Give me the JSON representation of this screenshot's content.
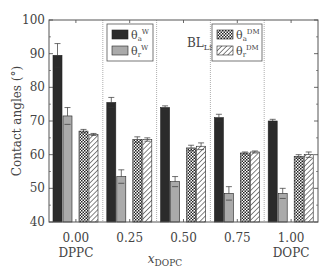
{
  "chart_data": {
    "type": "bar",
    "title": "",
    "xlabel": "x_DOPC",
    "xlabel_main": "x",
    "xlabel_sub": "DOPC",
    "ylabel": "Contact angles (°)",
    "ylim": [
      40,
      100
    ],
    "yticks": [
      40,
      50,
      60,
      70,
      80,
      90,
      100
    ],
    "categories": [
      "0.00",
      "0.25",
      "0.50",
      "0.75",
      "1.00"
    ],
    "category_sublabels": [
      "DPPC",
      "",
      "",
      "",
      "DOPC"
    ],
    "annotation": "BL_LS",
    "grid": false,
    "legend_position": "upper, split across panels",
    "series": [
      {
        "name": "θ_a^W",
        "style": "solid-dark",
        "values": [
          89.5,
          75.5,
          74.0,
          71.0,
          70.0
        ],
        "errors": [
          3.5,
          1.5,
          0.5,
          1.0,
          0.5
        ]
      },
      {
        "name": "θ_r^W",
        "style": "solid-light",
        "values": [
          71.5,
          53.5,
          52.0,
          48.5,
          48.5
        ],
        "errors": [
          2.5,
          2.0,
          1.5,
          2.0,
          1.5
        ]
      },
      {
        "name": "θ_a^DM",
        "style": "crosshatch",
        "values": [
          67.0,
          64.5,
          62.0,
          60.5,
          59.5
        ],
        "errors": [
          0.5,
          0.8,
          0.8,
          0.3,
          0.5
        ]
      },
      {
        "name": "θ_r^DM",
        "style": "diagonal-hatch",
        "values": [
          66.0,
          64.5,
          62.5,
          60.8,
          60.0
        ],
        "errors": [
          0.3,
          0.5,
          1.0,
          0.3,
          0.8
        ]
      }
    ]
  },
  "legend": [
    {
      "sym": "θ",
      "sub": "a",
      "sup": "W"
    },
    {
      "sym": "θ",
      "sub": "r",
      "sup": "W"
    },
    {
      "sym": "θ",
      "sub": "a",
      "sup": "DM"
    },
    {
      "sym": "θ",
      "sub": "r",
      "sup": "DM"
    }
  ]
}
